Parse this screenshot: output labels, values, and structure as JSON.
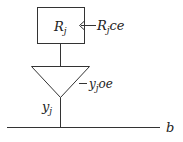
{
  "diagram": {
    "register": {
      "name": "R",
      "name_sub": "j",
      "clock_enable_label": "R",
      "clock_enable_sub": "j",
      "clock_enable_suffix": "ce"
    },
    "buffer": {
      "output_enable_label": "y",
      "output_enable_sub": "j",
      "output_enable_suffix": "oe",
      "output_label": "y",
      "output_sub": "j"
    },
    "bus": {
      "label": "b"
    }
  }
}
